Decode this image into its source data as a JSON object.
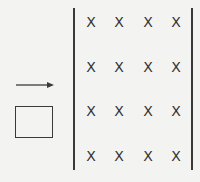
{
  "diagram": {
    "field_symbol": "X",
    "field_region": {
      "left_x": 74,
      "right_x": 192,
      "top_y": 8,
      "bottom_y": 170
    },
    "field_grid": {
      "columns_x": [
        91,
        119,
        148,
        176
      ],
      "rows_y": [
        22,
        67,
        111,
        156
      ]
    },
    "loop": {
      "x": 15,
      "y": 106,
      "width": 38,
      "height": 32
    },
    "velocity_arrow": {
      "x1": 16,
      "x2": 53,
      "y": 85,
      "direction": "right"
    },
    "colors": {
      "background": "#f3f3f1",
      "ink": "#3a3a3a"
    }
  }
}
